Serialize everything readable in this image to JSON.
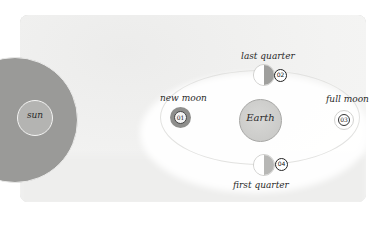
{
  "diagram": {
    "title": "",
    "bodies": {
      "sun": {
        "label": "sun"
      },
      "earth": {
        "label": "Earth"
      }
    },
    "phases": [
      {
        "id": "01",
        "label": "new moon"
      },
      {
        "id": "02",
        "label": "last quarter"
      },
      {
        "id": "03",
        "label": "full moon"
      },
      {
        "id": "04",
        "label": "first quarter"
      }
    ],
    "colors": {
      "background": "#ffffff",
      "card": "#f1f1f0",
      "sun_outer": "#9a9a98",
      "sun_inner": "#b4b4b2",
      "earth": "#d0d0ce",
      "moon_dark": "#9f9f9d",
      "moon_light": "#ffffff",
      "text": "#2a2a2a"
    }
  }
}
